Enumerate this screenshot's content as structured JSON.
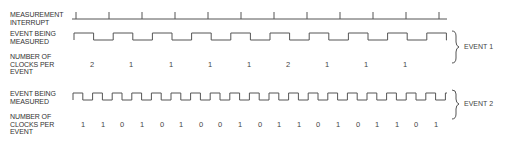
{
  "labels": {
    "interrupt": "MEASUREMENT\nINTERRUPT",
    "event_measured_1": "EVENT BEING\nMEASURED",
    "clocks_1": "NUMBER OF\nCLOCKS PER\nEVENT",
    "event_measured_2": "EVENT BEING\nMEASURED",
    "clocks_2": "NUMBER OF\nCLOCKS PER\nEVENT",
    "brace_1": "EVENT 1",
    "brace_2": "EVENT 2"
  },
  "interrupt": {
    "x0": 72,
    "x1": 447,
    "y": 19,
    "tick_height": 7,
    "ticks_x": [
      76,
      109,
      142,
      175,
      208,
      241,
      274,
      307,
      340,
      373,
      406,
      439
    ]
  },
  "event1": {
    "x0": 74,
    "x1": 447,
    "high_y": 33,
    "low_y": 40,
    "start_x": 74,
    "half_period": 19.6,
    "clocks": [
      "2",
      "1",
      "1",
      "1",
      "1",
      "2",
      "1",
      "1",
      "1"
    ],
    "clocks_x": [
      92,
      131,
      171,
      210,
      249,
      288,
      327,
      366,
      405
    ],
    "clocks_y": 60
  },
  "event2": {
    "x0": 73,
    "x1": 447,
    "high_y": 93,
    "low_y": 100,
    "start_x": 73,
    "half_period": 9.8,
    "clocks": [
      "1",
      "1",
      "0",
      "1",
      "0",
      "1",
      "0",
      "0",
      "1",
      "0",
      "1",
      "1",
      "0",
      "1",
      "0",
      "1",
      "1",
      "0",
      "1"
    ],
    "clocks_x": [
      83,
      103,
      122,
      142,
      162,
      181,
      201,
      220,
      240,
      260,
      279,
      299,
      318,
      338,
      358,
      377,
      397,
      416,
      436
    ],
    "clocks_y": 120
  },
  "colors": {
    "line": "#555555",
    "text": "#333333"
  }
}
